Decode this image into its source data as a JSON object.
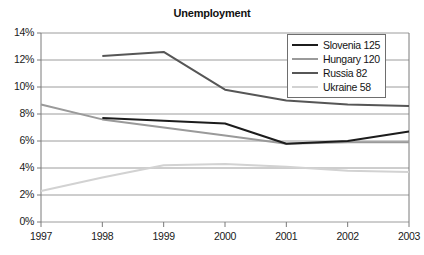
{
  "chart_data": {
    "type": "line",
    "title": "Unemployment",
    "xlabel": "",
    "ylabel": "",
    "x": [
      "1997",
      "1998",
      "1999",
      "2000",
      "2001",
      "2002",
      "2003"
    ],
    "categories": [
      "1997",
      "1998",
      "1999",
      "2000",
      "2001",
      "2002",
      "2003"
    ],
    "series": [
      {
        "name": "Slovenia 125",
        "legend_label": "Slovenia 125",
        "color": "#1c1c1c",
        "width": 2.0,
        "values": [
          null,
          7.7,
          7.5,
          7.3,
          5.8,
          6.0,
          6.7
        ]
      },
      {
        "name": "Hungary 120",
        "legend_label": "Hungary 120",
        "color": "#9a9a9a",
        "width": 2.0,
        "values": [
          8.7,
          7.6,
          7.0,
          6.4,
          5.8,
          5.9,
          5.9
        ]
      },
      {
        "name": "Russia 82",
        "legend_label": "Russia 82",
        "color": "#565656",
        "width": 2.0,
        "values": [
          null,
          12.3,
          12.6,
          9.8,
          9.0,
          8.7,
          8.6
        ]
      },
      {
        "name": "Ukraine 58",
        "legend_label": "Ukraine 58",
        "color": "#d2d2d2",
        "width": 2.0,
        "values": [
          2.3,
          3.3,
          4.2,
          4.3,
          4.1,
          3.8,
          3.7
        ]
      }
    ],
    "ylim": [
      0,
      14
    ],
    "yticks": [
      "0%",
      "2%",
      "4%",
      "6%",
      "8%",
      "10%",
      "12%",
      "14%"
    ],
    "ytick_values": [
      0,
      2,
      4,
      6,
      8,
      10,
      12,
      14
    ],
    "grid": true,
    "grid_color": "#9c9c9c",
    "axis_color": "#7a7a7a",
    "legend_position": "top-right",
    "background": "#ffffff"
  }
}
